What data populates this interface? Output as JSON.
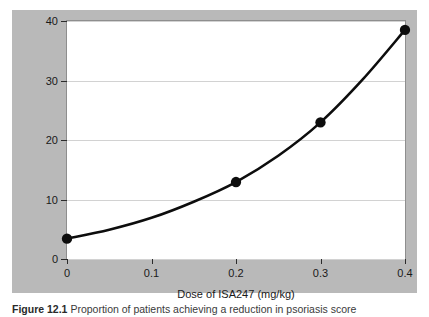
{
  "figure": {
    "panel_background": "#b9b9b9",
    "plot_background": "#ffffff",
    "caption_label": "Figure 12.1",
    "caption_text": "Proportion of patients achieving a reduction in psoriasis score"
  },
  "chart_data": {
    "type": "scatter",
    "title": "",
    "xlabel": "Dose of ISA247 (mg/kg)",
    "ylabel_line1": "Patients with 75% reduction",
    "ylabel_line2": "in psoriasis score (%)",
    "x": [
      0,
      0.2,
      0.3,
      0.4
    ],
    "values": [
      3.5,
      13.0,
      23.0,
      38.5
    ],
    "xlim": [
      0,
      0.4
    ],
    "ylim": [
      0,
      40
    ],
    "xticks": [
      0,
      0.1,
      0.2,
      0.3,
      0.4
    ],
    "xticklabels": [
      "0",
      "0.1",
      "0.2",
      "0.3",
      "0.4"
    ],
    "yticks": [
      0,
      10,
      20,
      30,
      40
    ],
    "yticklabels": [
      "0",
      "10",
      "20",
      "30",
      "40"
    ],
    "grid": "horizontal",
    "legend": "none",
    "marker_color": "#0d0d0d",
    "curve_color": "#0d0d0d",
    "fit_curve": {
      "description": "monotonic increasing fitted curve through the data points",
      "points": [
        [
          0,
          3.5
        ],
        [
          0.05,
          5.0
        ],
        [
          0.1,
          7.0
        ],
        [
          0.15,
          9.7
        ],
        [
          0.2,
          13.0
        ],
        [
          0.25,
          17.4
        ],
        [
          0.3,
          23.0
        ],
        [
          0.35,
          30.2
        ],
        [
          0.4,
          38.5
        ]
      ]
    }
  }
}
